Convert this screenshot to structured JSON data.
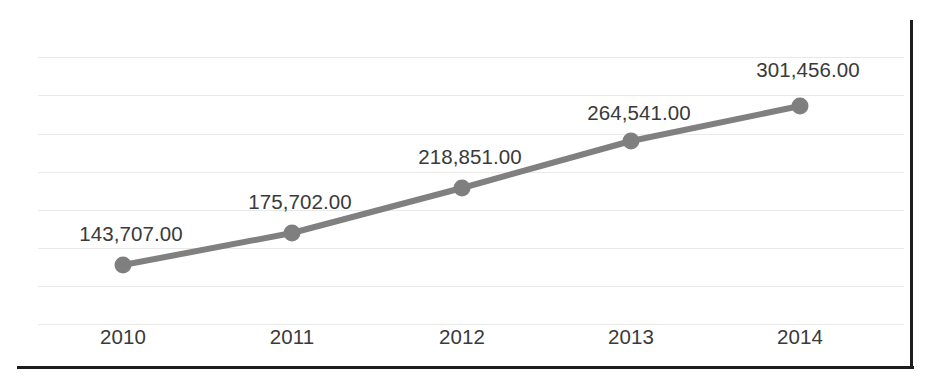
{
  "chart_data": {
    "type": "line",
    "title": "",
    "subtitle": "",
    "xlabel": "",
    "ylabel": "",
    "categories": [
      "2010",
      "2011",
      "2012",
      "2013",
      "2014"
    ],
    "values": [
      143707.0,
      175702.0,
      218851.0,
      264541.0,
      301456.0
    ],
    "data_labels": [
      "143,707.00",
      "175,702.00",
      "218,851.00",
      "264,541.00",
      "301,456.00"
    ],
    "series": [
      {
        "name": "",
        "values": [
          143707.0,
          175702.0,
          218851.0,
          264541.0,
          301456.0
        ]
      }
    ],
    "ylim": [
      0,
      350000
    ],
    "grid": true,
    "grid_axis": "y",
    "legend": false,
    "legend_position": "none",
    "marker": "circle",
    "colors": {
      "line": "#808080",
      "marker": "#7f7f7f",
      "gridline": "#e9e9e9",
      "text": "#3a3a3a",
      "frame": "#1d1d1d",
      "background": "#ffffff"
    },
    "points_px": [
      {
        "x": 123,
        "y": 265
      },
      {
        "x": 292,
        "y": 233
      },
      {
        "x": 462,
        "y": 188
      },
      {
        "x": 631,
        "y": 141
      },
      {
        "x": 800,
        "y": 106
      }
    ],
    "label_positions_px": [
      {
        "x": 131,
        "y": 222
      },
      {
        "x": 300,
        "y": 190
      },
      {
        "x": 470,
        "y": 145
      },
      {
        "x": 639,
        "y": 101
      },
      {
        "x": 808,
        "y": 58
      }
    ],
    "gridlines_px": [
      57,
      95,
      134,
      172,
      210,
      248,
      286,
      324
    ],
    "x_tick_positions_px": [
      123,
      292,
      462,
      631,
      800
    ]
  }
}
